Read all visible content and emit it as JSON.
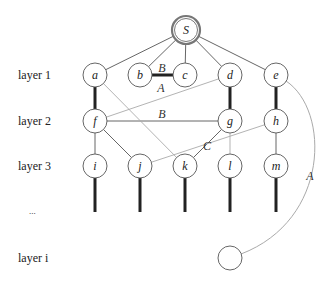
{
  "layers": [
    {
      "id": "layer1",
      "label": "layer 1"
    },
    {
      "id": "layer2",
      "label": "layer 2"
    },
    {
      "id": "layer3",
      "label": "layer 3"
    },
    {
      "id": "ellipsis",
      "label": "..."
    },
    {
      "id": "layeri",
      "label": "layer i"
    }
  ],
  "nodes": [
    {
      "id": "S",
      "label": "S",
      "root": true
    },
    {
      "id": "a",
      "label": "a"
    },
    {
      "id": "b",
      "label": "b"
    },
    {
      "id": "c",
      "label": "c"
    },
    {
      "id": "d",
      "label": "d"
    },
    {
      "id": "e",
      "label": "e"
    },
    {
      "id": "f",
      "label": "f"
    },
    {
      "id": "g",
      "label": "g"
    },
    {
      "id": "h",
      "label": "h"
    },
    {
      "id": "i",
      "label": "i"
    },
    {
      "id": "j",
      "label": "j"
    },
    {
      "id": "k",
      "label": "k"
    },
    {
      "id": "l",
      "label": "l"
    },
    {
      "id": "m",
      "label": "m"
    },
    {
      "id": "z",
      "label": ""
    }
  ],
  "edges": [
    {
      "from": "S",
      "to": "a",
      "style": "thin"
    },
    {
      "from": "S",
      "to": "b",
      "style": "thin"
    },
    {
      "from": "S",
      "to": "c",
      "style": "thin"
    },
    {
      "from": "S",
      "to": "d",
      "style": "thin"
    },
    {
      "from": "S",
      "to": "e",
      "style": "thin"
    },
    {
      "from": "b",
      "to": "c",
      "style": "thick",
      "label": "B"
    },
    {
      "from": "a",
      "to": "f",
      "style": "thick"
    },
    {
      "from": "d",
      "to": "g",
      "style": "thick"
    },
    {
      "from": "e",
      "to": "h",
      "style": "thick"
    },
    {
      "from": "d",
      "to": "f",
      "style": "gray",
      "label": "A"
    },
    {
      "from": "f",
      "to": "g",
      "style": "thin",
      "label": "B"
    },
    {
      "from": "a",
      "to": "k",
      "style": "gray"
    },
    {
      "from": "f",
      "to": "i",
      "style": "thin"
    },
    {
      "from": "f",
      "to": "j",
      "style": "thin"
    },
    {
      "from": "g",
      "to": "k",
      "style": "thin",
      "label": "C"
    },
    {
      "from": "g",
      "to": "l",
      "style": "gray"
    },
    {
      "from": "h",
      "to": "j",
      "style": "gray"
    },
    {
      "from": "h",
      "to": "m",
      "style": "thin"
    },
    {
      "from": "e",
      "to": "z",
      "style": "curve",
      "label": "A"
    }
  ],
  "stubs": [
    "i",
    "j",
    "k",
    "l",
    "m"
  ]
}
